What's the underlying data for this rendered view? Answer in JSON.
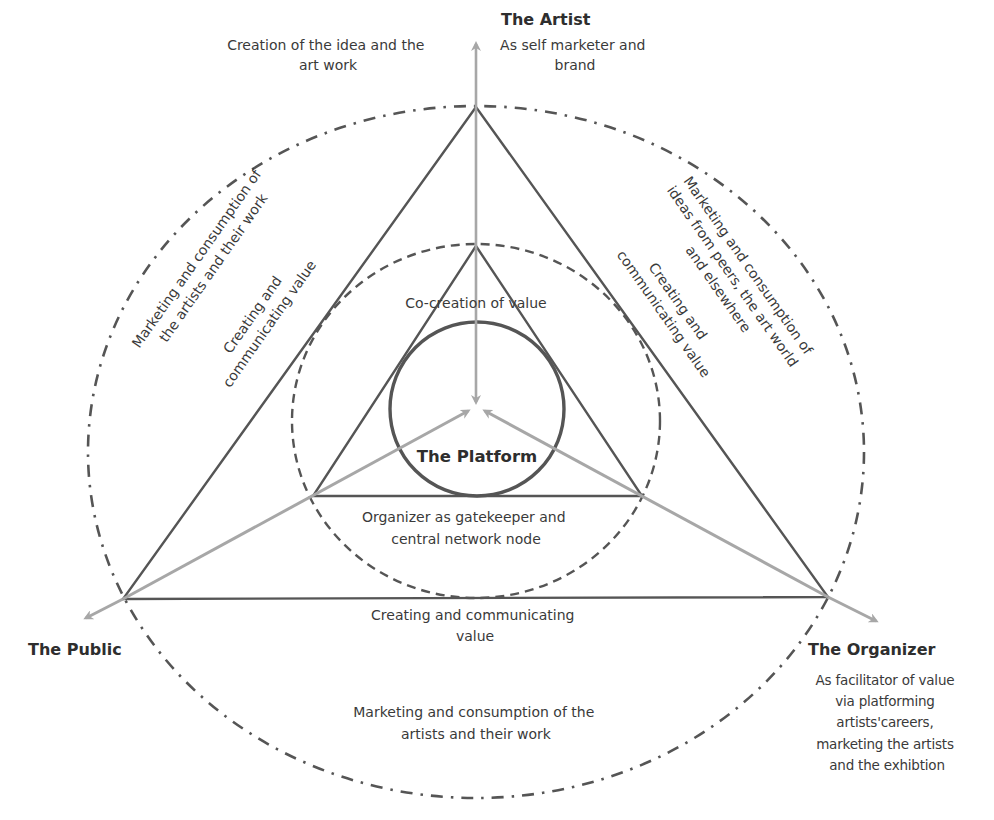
{
  "diagram": {
    "colors": {
      "background": "#ffffff",
      "line_dark": "#555555",
      "arrow_grey": "#a7a7a7",
      "text": "#3a3a3a"
    },
    "nodes": {
      "artist": {
        "title": "The Artist",
        "role_lines": [
          "As self marketer and",
          "brand"
        ]
      },
      "public": {
        "title": "The Public"
      },
      "organizer": {
        "title": "The Organizer",
        "role_lines": [
          "As facilitator of value",
          "via platforming",
          "artists'careers,",
          "marketing the artists",
          "and the exhibtion"
        ]
      },
      "platform": {
        "title": "The Platform"
      }
    },
    "labels": {
      "artist_creation": [
        "Creation of the idea and the",
        "art work"
      ],
      "left_outer": [
        "Marketing and consumption of",
        "the artists and their work"
      ],
      "left_inner": [
        "Creating and",
        "communicating value"
      ],
      "right_outer": [
        "Marketing and consumption of",
        "ideas from peers, the art world",
        "and elsewhere"
      ],
      "right_inner": [
        "Creating and",
        "communicating value"
      ],
      "co_creation": "Co-creation of value",
      "gatekeeper": [
        "Organizer as gatekeeper and",
        "central network node"
      ],
      "bottom_inner": [
        "Creating and communicating",
        "value"
      ],
      "bottom_outer": [
        "Marketing and consumption of the",
        "artists and their work"
      ]
    }
  }
}
